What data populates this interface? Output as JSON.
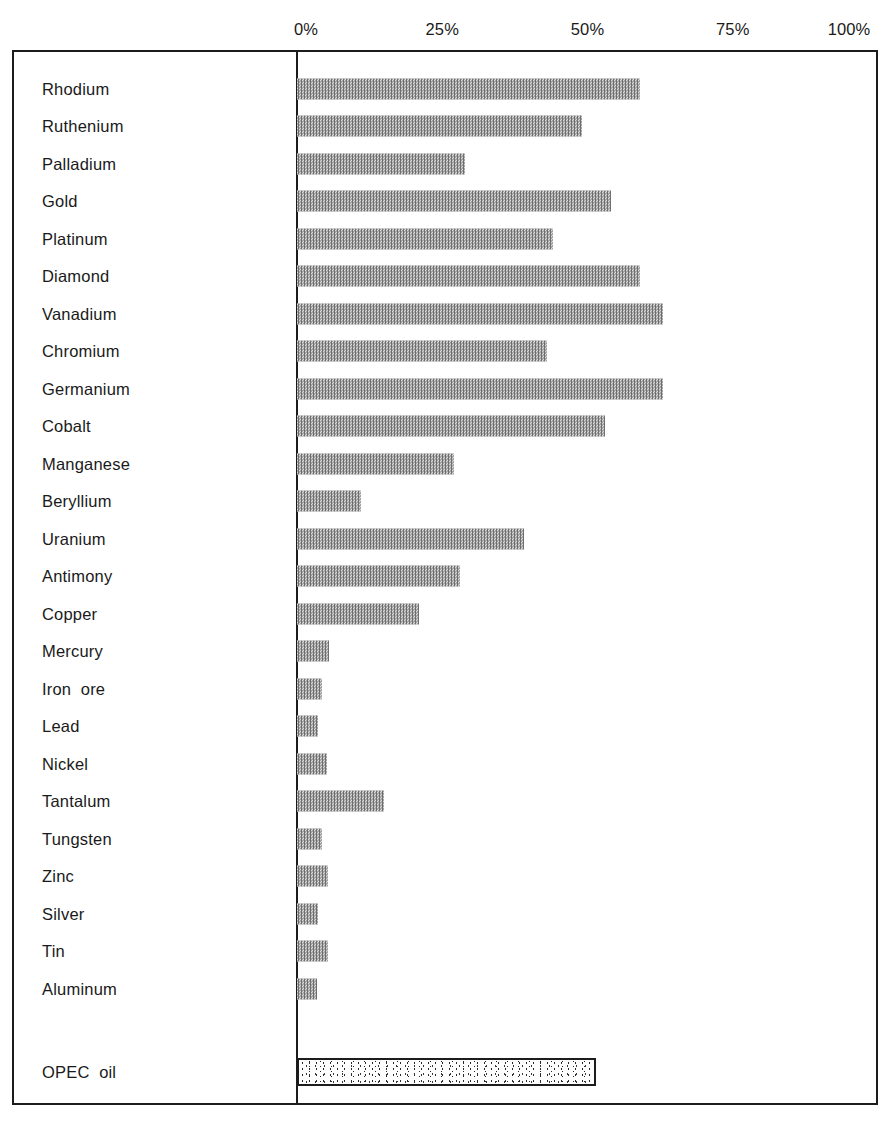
{
  "chart_data": {
    "type": "bar",
    "orientation": "horizontal",
    "title": "",
    "subtitle": "",
    "xlabel": "",
    "ylabel": "",
    "xlim": [
      0,
      100
    ],
    "grid": false,
    "legend": null,
    "axis": {
      "tick_labels": [
        "0%",
        "25%",
        "50%",
        "75%",
        "100%"
      ],
      "tick_values": [
        0,
        25,
        50,
        75,
        100
      ],
      "position": "top"
    },
    "categories": [
      "Rhodium",
      "Ruthenium",
      "Palladium",
      "Gold",
      "Platinum",
      "Diamond",
      "Vanadium",
      "Chromium",
      "Germanium",
      "Cobalt",
      "Manganese",
      "Beryllium",
      "Uranium",
      "Antimony",
      "Copper",
      "Mercury",
      "Iron  ore",
      "Lead",
      "Nickel",
      "Tantalum",
      "Tungsten",
      "Zinc",
      "Silver",
      "Tin",
      "Aluminum"
    ],
    "values": [
      59,
      49,
      29,
      54,
      44,
      59,
      63,
      43,
      63,
      53,
      27,
      11,
      39,
      28,
      21,
      5.5,
      4.3,
      3.6,
      5.2,
      15,
      4.3,
      5.3,
      3.6,
      5.3,
      3.4
    ],
    "highlight_series": {
      "name": "OPEC oil",
      "label": "OPEC  oil",
      "value": 51.5,
      "style": "stippled-outlined"
    },
    "bar_fill_color": "#6e6e6e",
    "frame_color": "#1c1c1c"
  }
}
